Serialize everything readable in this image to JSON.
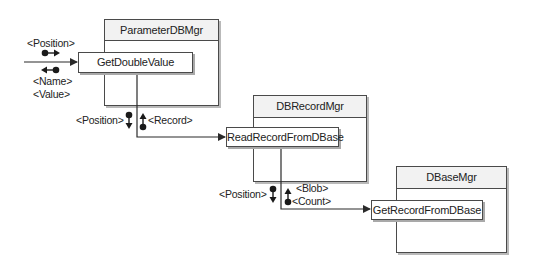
{
  "diagram": {
    "type": "sequence-of-calls",
    "classes": [
      {
        "name": "ParameterDBMgr",
        "method": "GetDoubleValue"
      },
      {
        "name": "DBRecordMgr",
        "method": "ReadRecordFromDBase"
      },
      {
        "name": "DBaseMgr",
        "method": "GetRecordFromDBase"
      }
    ],
    "calls": [
      {
        "to": "GetDoubleValue",
        "inputs": [
          "<Position>"
        ],
        "outputs": [
          "<Name>",
          "<Value>"
        ]
      },
      {
        "from": "GetDoubleValue",
        "to": "ReadRecordFromDBase",
        "inputs": [
          "<Position>"
        ],
        "outputs": [
          "<Record>"
        ]
      },
      {
        "from": "ReadRecordFromDBase",
        "to": "GetRecordFromDBase",
        "inputs": [
          "<Position>"
        ],
        "outputs": [
          "<Blob>",
          "<Count>"
        ]
      }
    ]
  },
  "colors": {
    "line": "#2a2a2a",
    "border": "#4a4a4a",
    "header_fill": "#f2f2f2",
    "shadow": "#b9b9b9"
  }
}
